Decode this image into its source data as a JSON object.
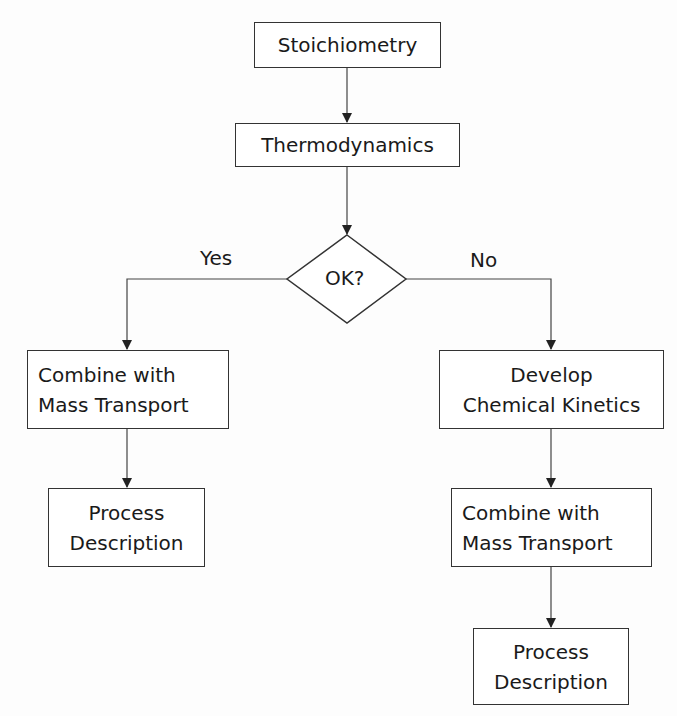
{
  "diagram": {
    "type": "flowchart",
    "nodes": {
      "stoichiometry": "Stoichiometry",
      "thermodynamics": "Thermodynamics",
      "decision": "OK?",
      "yes_combine": "Combine with Mass Transport",
      "yes_process": "Process Description",
      "no_kinetics": "Develop Chemical Kinetics",
      "no_combine": "Combine with Mass Transport",
      "no_process": "Process Description"
    },
    "lines": {
      "yes_combine": [
        "Combine with",
        "Mass Transport"
      ],
      "yes_process": [
        "Process",
        "Description"
      ],
      "no_kinetics": [
        "Develop",
        "Chemical Kinetics"
      ],
      "no_combine": [
        "Combine with",
        "Mass Transport"
      ],
      "no_process": [
        "Process",
        "Description"
      ]
    },
    "edge_labels": {
      "yes": "Yes",
      "no": "No"
    },
    "edges": [
      [
        "stoichiometry",
        "thermodynamics"
      ],
      [
        "thermodynamics",
        "decision"
      ],
      [
        "decision",
        "yes_combine",
        "Yes"
      ],
      [
        "decision",
        "no_kinetics",
        "No"
      ],
      [
        "yes_combine",
        "yes_process"
      ],
      [
        "no_kinetics",
        "no_combine"
      ],
      [
        "no_combine",
        "no_process"
      ]
    ]
  }
}
